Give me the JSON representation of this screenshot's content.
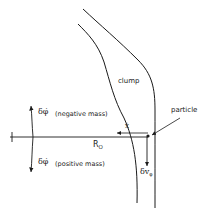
{
  "diagram": {
    "labels": {
      "clump": "clump",
      "particle": "particle",
      "r0": "R",
      "r0_sub": "O",
      "x_dot": "ẋ",
      "delta_phi_neg": "δφ̇",
      "neg_mass": "(negative mass)",
      "delta_phi_pos": "δφ̇",
      "pos_mass": "(positive mass)",
      "delta_v": "δv",
      "delta_v_sub": "φ"
    },
    "colors": {
      "ink": "#1a1a1a",
      "background": "#ffffff"
    }
  }
}
